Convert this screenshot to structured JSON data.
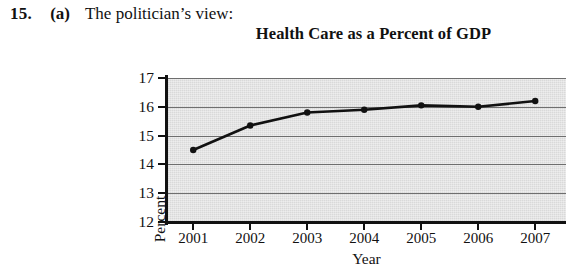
{
  "problem": {
    "number": "15.",
    "part": "(a)",
    "prompt": "The politician’s view:"
  },
  "chart_data": {
    "type": "line",
    "title": "Health Care as a Percent of GDP",
    "xlabel": "Year",
    "ylabel": "Percent",
    "categories": [
      "2001",
      "2002",
      "2003",
      "2004",
      "2005",
      "2006",
      "2007"
    ],
    "values": [
      14.5,
      15.35,
      15.8,
      15.9,
      16.05,
      16.0,
      16.2
    ],
    "series": [
      {
        "name": "Health care percent of GDP",
        "values": [
          14.5,
          15.35,
          15.8,
          15.9,
          16.05,
          16.0,
          16.2
        ]
      }
    ],
    "ylim": [
      12,
      17
    ],
    "ytick_labels": [
      "17",
      "16",
      "15",
      "14",
      "13",
      "12"
    ],
    "ytick_values": [
      17,
      16,
      15,
      14,
      13,
      12
    ],
    "xtick_labels": [
      "2001",
      "2002",
      "2003",
      "2004",
      "2005",
      "2006",
      "2007"
    ],
    "grid": true,
    "legend": "none",
    "marker": "filled-circle",
    "line_color": "#111111",
    "plot_background_color": "#d9d9d9",
    "gridline_color": "#6e6e6e"
  }
}
